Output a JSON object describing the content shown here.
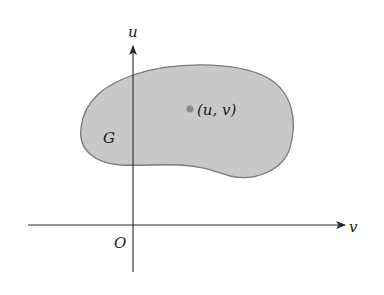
{
  "diagram": {
    "axes": {
      "vertical_label": "u",
      "horizontal_label": "v",
      "origin_label": "O"
    },
    "region": {
      "label": "G",
      "fill_color": "#c8c8c8",
      "stroke_color": "#7a7a7a"
    },
    "point": {
      "label": "(u, v)",
      "color": "#8a8a8a"
    },
    "colors": {
      "axis": "#2a2a2a",
      "background": "#ffffff"
    }
  }
}
